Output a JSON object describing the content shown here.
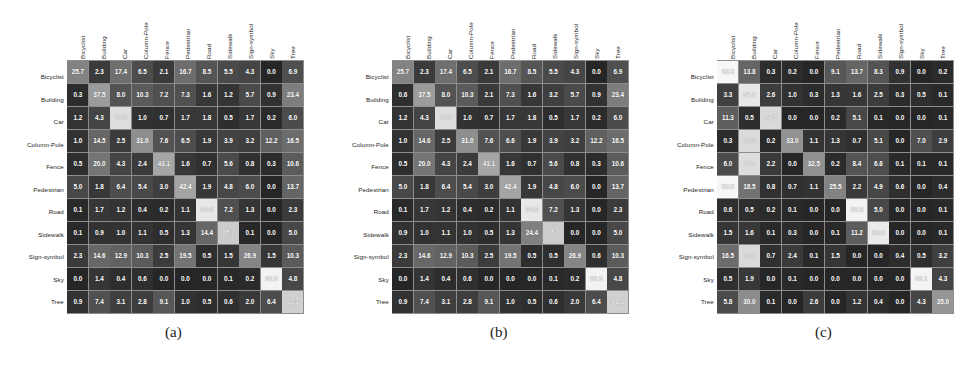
{
  "figure": {
    "classes": [
      "Bicyclist",
      "Building",
      "Car",
      "Column-Pole",
      "Fence",
      "Pedestrian",
      "Road",
      "Sidewalk",
      "Sign-symbol",
      "Sky",
      "Tree"
    ],
    "captions": [
      "(a)",
      "(b)",
      "(c)"
    ]
  },
  "chart_data": [
    {
      "type": "heatmap",
      "title": "(a)",
      "xlabel": "",
      "ylabel": "",
      "x_tick_labels": [
        "Bicyclist",
        "Building",
        "Car",
        "Column-Pole",
        "Fence",
        "Pedestrian",
        "Road",
        "Sidewalk",
        "Sign-symbol",
        "Sky",
        "Tree"
      ],
      "y_tick_labels": [
        "Bicyclist",
        "Building",
        "Car",
        "Column-Pole",
        "Fence",
        "Pedestrian",
        "Road",
        "Sidewalk",
        "Sign-symbol",
        "Sky",
        "Tree"
      ],
      "grid": false,
      "legend": "none",
      "zlim": [
        0,
        100
      ],
      "values": [
        [
          25.7,
          2.3,
          17.4,
          6.5,
          2.1,
          16.7,
          8.5,
          5.5,
          4.3,
          0.0,
          6.9
        ],
        [
          0.3,
          37.5,
          8.0,
          10.3,
          7.2,
          7.3,
          1.6,
          1.2,
          5.7,
          0.9,
          23.4
        ],
        [
          1.2,
          4.3,
          77.0,
          1.0,
          0.7,
          1.7,
          1.8,
          0.5,
          1.7,
          0.2,
          6.0
        ],
        [
          1.0,
          14.5,
          2.5,
          31.0,
          7.6,
          6.5,
          1.9,
          3.9,
          3.2,
          12.2,
          16.5
        ],
        [
          0.5,
          20.0,
          4.3,
          2.4,
          43.1,
          1.6,
          0.7,
          5.6,
          0.8,
          0.3,
          10.6
        ],
        [
          5.0,
          1.8,
          6.4,
          5.4,
          3.0,
          42.4,
          1.9,
          4.8,
          6.0,
          0.0,
          13.7
        ],
        [
          0.1,
          1.7,
          1.2,
          0.4,
          0.2,
          1.1,
          84.6,
          7.2,
          1.3,
          0.0,
          2.3
        ],
        [
          0.1,
          0.9,
          1.0,
          1.1,
          0.5,
          1.3,
          14.4,
          65.7,
          0.1,
          0.0,
          5.0
        ],
        [
          2.3,
          14.6,
          12.9,
          10.3,
          2.5,
          19.5,
          0.5,
          1.5,
          26.9,
          1.5,
          10.3
        ],
        [
          0.0,
          1.4,
          0.4,
          0.6,
          0.0,
          0.0,
          0.0,
          0.1,
          0.2,
          92.5,
          4.8
        ],
        [
          0.9,
          7.4,
          3.1,
          2.8,
          9.1,
          1.0,
          0.5,
          0.6,
          2.0,
          6.4,
          68.2
        ]
      ]
    },
    {
      "type": "heatmap",
      "title": "(b)",
      "xlabel": "",
      "ylabel": "",
      "x_tick_labels": [
        "Bicyclist",
        "Building",
        "Car",
        "Column-Pole",
        "Fence",
        "Pedestrian",
        "Road",
        "Sidewalk",
        "Sign-symbol",
        "Sky",
        "Tree"
      ],
      "y_tick_labels": [
        "Bicyclist",
        "Building",
        "Car",
        "Column-Pole",
        "Fence",
        "Pedestrian",
        "Road",
        "Sidewalk",
        "Sign-symbol",
        "Sky",
        "Tree"
      ],
      "grid": false,
      "legend": "none",
      "zlim": [
        0,
        100
      ],
      "values": [
        [
          25.7,
          2.3,
          17.4,
          6.5,
          2.1,
          16.7,
          8.5,
          5.5,
          4.3,
          0.0,
          6.9
        ],
        [
          0.6,
          37.5,
          8.0,
          10.3,
          2.1,
          7.3,
          1.6,
          3.2,
          5.7,
          0.9,
          23.4
        ],
        [
          1.2,
          4.3,
          77.0,
          1.0,
          0.7,
          1.7,
          1.8,
          0.5,
          1.7,
          0.2,
          6.0
        ],
        [
          1.0,
          14.6,
          2.5,
          31.0,
          7.6,
          6.6,
          1.9,
          3.9,
          3.2,
          12.2,
          16.5
        ],
        [
          0.5,
          20.0,
          4.3,
          2.4,
          43.1,
          1.6,
          0.7,
          5.6,
          0.8,
          0.3,
          10.6
        ],
        [
          5.0,
          1.8,
          6.4,
          5.4,
          3.0,
          42.4,
          1.9,
          4.8,
          6.0,
          0.0,
          13.7
        ],
        [
          0.1,
          1.7,
          1.2,
          0.4,
          0.2,
          1.1,
          84.6,
          7.2,
          1.3,
          0.0,
          2.3
        ],
        [
          0.9,
          1.0,
          1.1,
          1.0,
          0.5,
          1.3,
          24.4,
          65.7,
          0.0,
          0.0,
          5.0
        ],
        [
          2.3,
          14.6,
          12.9,
          10.3,
          2.5,
          19.5,
          0.5,
          0.5,
          26.9,
          0.6,
          10.3
        ],
        [
          0.0,
          1.4,
          0.4,
          0.6,
          0.0,
          0.0,
          0.0,
          0.1,
          0.2,
          92.5,
          4.8
        ],
        [
          0.9,
          7.4,
          3.1,
          2.8,
          9.1,
          1.0,
          0.5,
          0.6,
          2.0,
          6.4,
          68.2
        ]
      ]
    },
    {
      "type": "heatmap",
      "title": "(c)",
      "xlabel": "",
      "ylabel": "",
      "x_tick_labels": [
        "Bicyclist",
        "Building",
        "Car",
        "Column-Pole",
        "Fence",
        "Pedestrian",
        "Road",
        "Sidewalk",
        "Sign-symbol",
        "Sky",
        "Tree"
      ],
      "y_tick_labels": [
        "Bicyclist",
        "Building",
        "Car",
        "Column-Pole",
        "Fence",
        "Pedestrian",
        "Road",
        "Sidewalk",
        "Sign-symbol",
        "Sky",
        "Tree"
      ],
      "grid": false,
      "legend": "none",
      "zlim": [
        0,
        100
      ],
      "values": [
        [
          95.5,
          13.8,
          0.3,
          0.2,
          0.0,
          9.1,
          13.7,
          8.3,
          0.9,
          0.0,
          0.2
        ],
        [
          3.3,
          84.2,
          2.6,
          1.0,
          0.3,
          1.3,
          1.6,
          2.5,
          0.3,
          0.5,
          0.1
        ],
        [
          11.3,
          0.5,
          74.6,
          0.0,
          0.0,
          0.2,
          5.1,
          0.1,
          0.0,
          0.0,
          0.1
        ],
        [
          0.3,
          76.0,
          0.2,
          33.0,
          1.1,
          1.3,
          0.7,
          5.1,
          0.0,
          7.0,
          2.9
        ],
        [
          6.0,
          77.5,
          2.2,
          0.0,
          32.5,
          0.2,
          8.4,
          6.6,
          0.1,
          0.1,
          0.1
        ],
        [
          95.5,
          18.5,
          0.8,
          0.7,
          1.1,
          25.5,
          2.2,
          4.9,
          0.6,
          0.0,
          0.4
        ],
        [
          0.6,
          0.5,
          0.2,
          0.1,
          0.0,
          0.0,
          92.5,
          5.0,
          0.0,
          0.0,
          0.1
        ],
        [
          1.5,
          1.6,
          0.1,
          0.3,
          0.0,
          0.1,
          11.2,
          85.8,
          0.0,
          0.0,
          0.1
        ],
        [
          16.5,
          75.2,
          0.7,
          2.4,
          0.1,
          1.5,
          0.0,
          0.0,
          0.4,
          0.5,
          3.2
        ],
        [
          0.5,
          1.9,
          0.0,
          0.1,
          0.0,
          0.0,
          0.0,
          0.0,
          0.0,
          93.1,
          4.3
        ],
        [
          5.8,
          30.0,
          0.1,
          0.0,
          2.6,
          0.0,
          1.2,
          0.4,
          0.0,
          4.3,
          35.0
        ]
      ]
    }
  ]
}
